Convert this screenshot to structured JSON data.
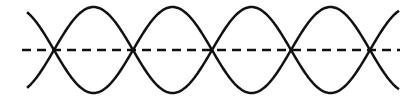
{
  "diagram": {
    "type": "standing-wave",
    "nodes_x": [
      54,
      133,
      211,
      290,
      370
    ],
    "x_start": 27,
    "x_end": 399,
    "center_y": 50,
    "amplitude": 43,
    "axis": {
      "x1": 22,
      "x2": 400,
      "style": "dashed"
    },
    "colors": {
      "stroke": "#111111",
      "background": "#ffffff"
    }
  }
}
